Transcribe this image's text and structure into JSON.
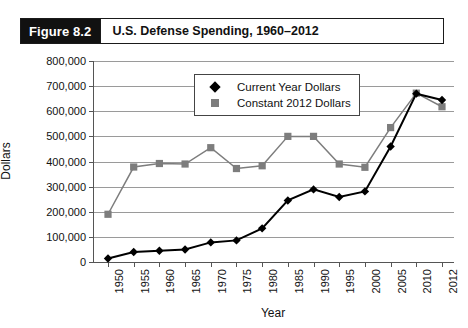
{
  "figure": {
    "number_label": "Figure 8.2",
    "caption": "U.S. Defense Spending, 1960–2012"
  },
  "chart_data": {
    "type": "line",
    "title": "U.S. Defense Spending, 1960–2012",
    "xlabel": "Year",
    "ylabel": "Dollars",
    "categories": [
      "1950",
      "1955",
      "1960",
      "1965",
      "1970",
      "1975",
      "1980",
      "1985",
      "1990",
      "1995",
      "2000",
      "2005",
      "2010",
      "2012"
    ],
    "ylim": [
      0,
      800000
    ],
    "ytick_step": 100000,
    "ytick_labels": [
      "0",
      "100,000",
      "200,000",
      "300,000",
      "400,000",
      "500,000",
      "600,000",
      "700,000",
      "800,000"
    ],
    "grid": true,
    "legend_position": "top-left inside",
    "series": [
      {
        "name": "Current Year Dollars",
        "color": "#000000",
        "marker": "diamond",
        "values": [
          14000,
          40000,
          45000,
          50000,
          78000,
          86000,
          134000,
          245000,
          289000,
          259000,
          281000,
          460000,
          670000,
          645000
        ]
      },
      {
        "name": "Constant 2012 Dollars",
        "color": "#7d7d7d",
        "marker": "square",
        "values": [
          190000,
          378000,
          392000,
          390000,
          455000,
          372000,
          383000,
          500000,
          500000,
          390000,
          377000,
          535000,
          672000,
          618000
        ]
      }
    ]
  }
}
